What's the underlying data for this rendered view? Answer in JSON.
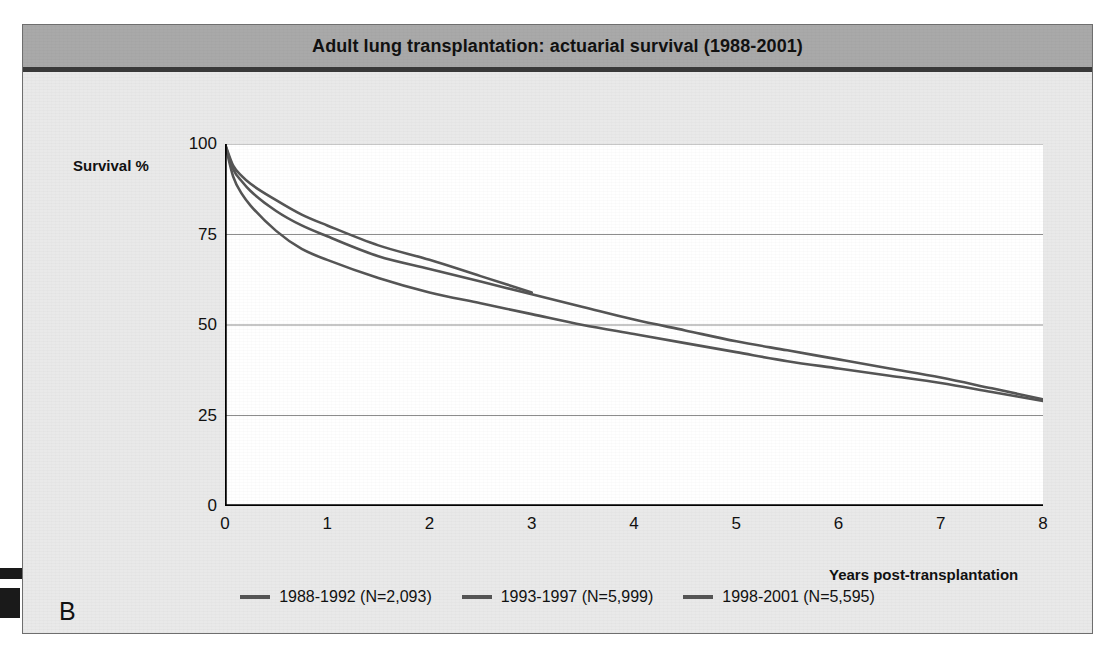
{
  "figure": {
    "panel_label": "B",
    "title": "Adult lung transplantation: actuarial survival (1988-2001)"
  },
  "axes": {
    "y_axis_title": "Survival %",
    "x_axis_title": "Years post-transplantation",
    "y_ticks": [
      "0",
      "25",
      "50",
      "75",
      "100"
    ],
    "x_ticks": [
      "0",
      "1",
      "2",
      "3",
      "4",
      "5",
      "6",
      "7",
      "8"
    ]
  },
  "colors": {
    "title_bar": "#a9a9a9",
    "figure_background": "#e9e9e9",
    "plot_background": "#ffffff",
    "curve": "#555555",
    "gridline": "#8d8d8d",
    "axis": "#000000"
  },
  "chart_data": {
    "type": "line",
    "title": "Adult lung transplantation: actuarial survival (1988-2001)",
    "xlabel": "Years post-transplantation",
    "ylabel": "Survival %",
    "xlim": [
      0,
      8
    ],
    "ylim": [
      0,
      100
    ],
    "grid": true,
    "grid_axis": "y",
    "legend_position": "bottom",
    "series": [
      {
        "name": "1988-1992",
        "legend_label": "1988-1992  (N=2,093)",
        "n": 2093,
        "color": "#555555",
        "x": [
          0,
          0.08,
          0.17,
          0.25,
          0.5,
          0.75,
          1,
          1.5,
          2,
          2.5,
          3,
          3.5,
          4,
          4.5,
          5,
          5.5,
          6,
          6.5,
          7,
          7.5,
          8
        ],
        "y": [
          100,
          91,
          86,
          83,
          76,
          71,
          68,
          63,
          59,
          56,
          53,
          50,
          47.5,
          45,
          42.5,
          40,
          38,
          36,
          34,
          31.5,
          29
        ]
      },
      {
        "name": "1993-1997",
        "legend_label": "1993-1997  (N=5,999)",
        "n": 5999,
        "color": "#555555",
        "x": [
          0,
          0.08,
          0.17,
          0.25,
          0.5,
          0.75,
          1,
          1.5,
          2,
          2.5,
          3,
          3.5,
          4,
          4.5,
          5,
          5.5,
          6,
          6.5,
          7,
          7.5,
          8
        ],
        "y": [
          100,
          93,
          89.5,
          87,
          81.5,
          77.5,
          74.5,
          69,
          65.5,
          62,
          58.5,
          55,
          51.5,
          48.5,
          45.5,
          43,
          40.5,
          38,
          35.5,
          32.5,
          29.5
        ]
      },
      {
        "name": "1998-2001",
        "legend_label": "1998-2001  (N=5,595)",
        "n": 5595,
        "color": "#555555",
        "x": [
          0,
          0.08,
          0.17,
          0.25,
          0.5,
          0.75,
          1,
          1.5,
          2,
          2.5,
          3
        ],
        "y": [
          100,
          94,
          91,
          89,
          84.5,
          80.5,
          77.5,
          72,
          68,
          63.5,
          59
        ]
      }
    ]
  }
}
